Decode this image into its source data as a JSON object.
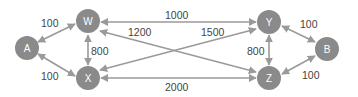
{
  "diagram": {
    "type": "weighted-graph",
    "colors": {
      "node": "#8a8a8a",
      "edge": "#9a9a9a",
      "label": "#444444",
      "node_text": "#ffffff"
    },
    "nodes": [
      {
        "id": "A",
        "label": "A"
      },
      {
        "id": "W",
        "label": "W"
      },
      {
        "id": "X",
        "label": "X"
      },
      {
        "id": "Y",
        "label": "Y"
      },
      {
        "id": "Z",
        "label": "Z"
      },
      {
        "id": "B",
        "label": "B"
      }
    ],
    "edges": [
      {
        "from": "A",
        "to": "W",
        "weight": "100",
        "bidirectional": true
      },
      {
        "from": "A",
        "to": "X",
        "weight": "100",
        "bidirectional": true
      },
      {
        "from": "W",
        "to": "X",
        "weight": "800",
        "bidirectional": true
      },
      {
        "from": "W",
        "to": "Y",
        "weight": "1000",
        "bidirectional": true
      },
      {
        "from": "W",
        "to": "Z",
        "weight": "1200",
        "bidirectional": true
      },
      {
        "from": "X",
        "to": "Y",
        "weight": "1500",
        "bidirectional": true
      },
      {
        "from": "X",
        "to": "Z",
        "weight": "2000",
        "bidirectional": true
      },
      {
        "from": "Y",
        "to": "Z",
        "weight": "800",
        "bidirectional": true
      },
      {
        "from": "Y",
        "to": "B",
        "weight": "100",
        "bidirectional": true
      },
      {
        "from": "Z",
        "to": "B",
        "weight": "100",
        "bidirectional": true
      }
    ]
  }
}
